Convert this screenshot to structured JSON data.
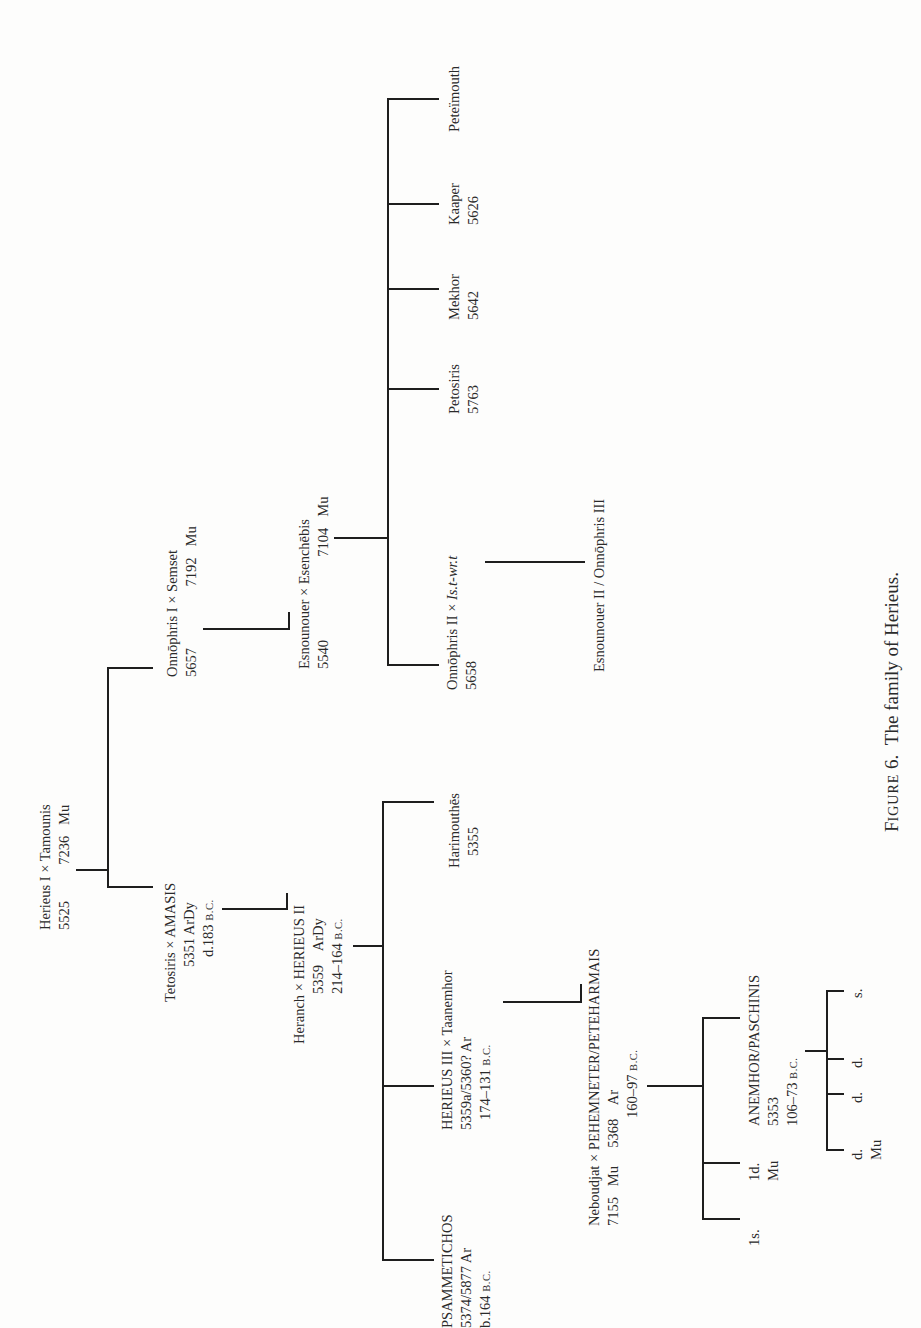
{
  "figure": {
    "label": "Figure 6.",
    "label_first": "F",
    "label_rest": "IGURE",
    "label_num": "6.",
    "title": "The family of Herieus."
  },
  "nodes": {
    "gen1": {
      "line1": "Herieus I × Tamounis",
      "line2": "5525          7236   Mu"
    },
    "onnophris1": {
      "line1": "Onnōphris I × Semset",
      "line2": "5657                 7192   Mu"
    },
    "tetosiris": {
      "line1": "Tetosiris × AMASIS",
      "line2": "5351 ArDy",
      "line3_num": "d.183 ",
      "line3_era": "B.C."
    },
    "esnounouer": {
      "line1": "Esnounouer × Esenchēbis",
      "line2": "5540                       7104   Mu"
    },
    "heranch": {
      "line1": "Heranch × HERIEUS II",
      "line2": "5359    ArDy",
      "line3_num": "214–164 ",
      "line3_era": "B.C."
    },
    "onnophris2": {
      "line1": "Onnōphris II × ",
      "line1_italic": "Is.t-wr.t",
      "line2": "5658"
    },
    "esnounouer2": {
      "line1": "Esnounouer II / Onnōphris III"
    },
    "petosiris": {
      "line1": "Petosiris",
      "line2": "5763"
    },
    "mekhor": {
      "line1": "Mekhor",
      "line2": "5642"
    },
    "kaaper": {
      "line1": "Kaaper",
      "line2": "5626"
    },
    "peteimouth": {
      "line1": "Peteïmouth"
    },
    "psammetichos": {
      "line1": "PSAMMETICHOS",
      "line2": "5374/5877 Ar",
      "line3_num": "b.164 ",
      "line3_era": "B.C."
    },
    "herieus3": {
      "line1": "HERIEUS III × Taanemhor",
      "line2": "5359a/5360? Ar",
      "line3_num": "174–131 ",
      "line3_era": "B.C."
    },
    "harimouthes": {
      "line1": "Harimouthēs",
      "line2": "5355"
    },
    "neboudjat": {
      "line1": "Neboudjat × PEHEMNETER/PETEHARMAIS",
      "line2": "7155   Mu     5368    Ar",
      "line3_num": "160–97 ",
      "line3_era": "B.C."
    },
    "son1": {
      "line1": "1s."
    },
    "daughter1": {
      "line1": "1d.",
      "line2": "Mu"
    },
    "anemhor": {
      "line1": "ANEMHOR/PASCHINIS",
      "line2": "5353",
      "line3_num": "106–73 ",
      "line3_era": "B.C."
    },
    "gc_d1": {
      "line1": "d.",
      "line2": "Mu"
    },
    "gc_d2": {
      "line1": "d."
    },
    "gc_d3": {
      "line1": "d."
    },
    "gc_s": {
      "line1": "s."
    }
  }
}
